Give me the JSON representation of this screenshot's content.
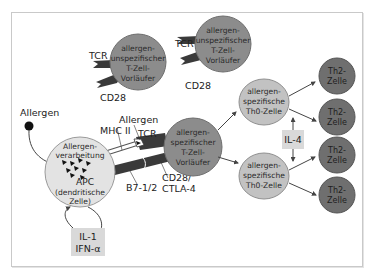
{
  "colors": {
    "background": "#ffffff",
    "frame_border": "#c9c9c9",
    "naive_cell": "#8c8c8c",
    "naive_cell_border": "#6e6e6e",
    "specific_precursor": "#8c8c8c",
    "th0_cell": "#c2c2c2",
    "th0_border": "#8f8f8f",
    "th2_cell": "#6f6f6f",
    "th2_border": "#555555",
    "apc_cell": "#e3e3e3",
    "apc_border": "#9a9a9a",
    "receptor": "#3a3a3a",
    "cytokine_box": "#d9d9d9",
    "arrow": "#444444"
  },
  "nonspecific_cells": [
    {
      "lines": [
        "allergen-",
        "unspezifischer",
        "T-Zell-",
        "Vorläufer"
      ],
      "tcr_label": "TCR",
      "cd28_label": "CD28"
    },
    {
      "lines": [
        "allergen-",
        "unspezifischer",
        "T-Zell-",
        "Vorläufer"
      ],
      "tcr_label": "TCR",
      "cd28_label": "CD28"
    }
  ],
  "allergen_source": {
    "label": "Allergen"
  },
  "apc": {
    "lines": [
      "Allergen-",
      "verarbeitung"
    ],
    "name_lines": [
      "APC",
      "(dendritische",
      "Zelle)"
    ]
  },
  "apc_cytokines": {
    "lines": [
      "IL-1",
      "IFN-α"
    ]
  },
  "synapse_labels": {
    "allergen": "Allergen",
    "mhc": "MHC II",
    "tcr": "TCR",
    "b7": "B7-1/2",
    "cd28_line1": "CD28/",
    "cd28_line2": "CTLA-4"
  },
  "specific_precursor": {
    "lines": [
      "allergen-",
      "spezifischer",
      "T-Zell-",
      "Vorläufer"
    ]
  },
  "th0_cells": [
    {
      "lines": [
        "allergen-",
        "spezifische",
        "Th0-Zelle"
      ]
    },
    {
      "lines": [
        "allergen-",
        "spezifische",
        "Th0-Zelle"
      ]
    }
  ],
  "il4_box": {
    "label": "IL-4"
  },
  "th2_cells": [
    {
      "lines": [
        "Th2-",
        "Zelle"
      ]
    },
    {
      "lines": [
        "Th2-",
        "Zelle"
      ]
    },
    {
      "lines": [
        "Th2-",
        "Zelle"
      ]
    },
    {
      "lines": [
        "Th2-",
        "Zelle"
      ]
    }
  ]
}
